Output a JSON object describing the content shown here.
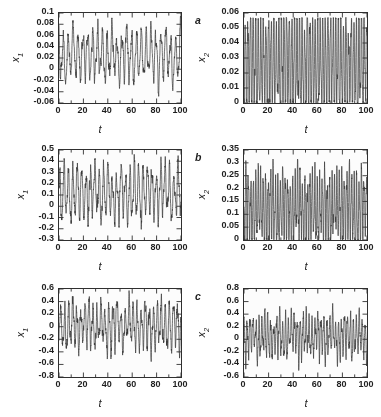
{
  "figure": {
    "rows": [
      "a",
      "b",
      "c"
    ],
    "line_color": "#333333",
    "frame_color": "#2b2b2b",
    "background": "#ffffff"
  },
  "chart_data": [
    {
      "id": "a-x1",
      "type": "line",
      "panel_label": "a",
      "title": "",
      "xlabel": "t",
      "ylabel": "x1",
      "ylabel_base": "x",
      "ylabel_sub": "1",
      "xlim": [
        0,
        100
      ],
      "ylim": [
        -0.06,
        0.1
      ],
      "xticks": [
        0,
        20,
        40,
        60,
        80,
        100
      ],
      "xticklabels": [
        "0",
        "20",
        "40",
        "60",
        "80",
        "100"
      ],
      "yticks": [
        -0.06,
        -0.04,
        -0.02,
        0,
        0.02,
        0.04,
        0.06,
        0.08,
        0.1
      ],
      "yticklabels": [
        "-0.06",
        "-0.04",
        "-0.02",
        "0",
        "0.02",
        "0.04",
        "0.06",
        "0.08",
        "0.1"
      ],
      "x_minor_step": 10,
      "grid": false,
      "legend": null,
      "series_description": "Chaotic oscillation, mean approx 0.025, spikes to 0.1 and dips to -0.055, dominant period approx 4 time units with slow amplitude modulation",
      "signal": {
        "mean": 0.025,
        "fast_period": 4.0,
        "fast_amp": 0.032,
        "slow_period": 11.0,
        "slow_amp": 0.022,
        "noise": 0.01,
        "clip_min": -0.058,
        "clip_max": 0.1
      }
    },
    {
      "id": "a-x2",
      "type": "line",
      "panel_label": "a",
      "title": "",
      "xlabel": "t",
      "ylabel": "x2",
      "ylabel_base": "x",
      "ylabel_sub": "2",
      "xlim": [
        0,
        100
      ],
      "ylim": [
        0,
        0.06
      ],
      "xticks": [
        0,
        20,
        40,
        60,
        80,
        100
      ],
      "xticklabels": [
        "0",
        "20",
        "40",
        "60",
        "80",
        "100"
      ],
      "yticks": [
        0,
        0.01,
        0.02,
        0.03,
        0.04,
        0.05,
        0.06
      ],
      "yticklabels": [
        "0",
        "0.01",
        "0.02",
        "0.03",
        "0.04",
        "0.05",
        "0.06"
      ],
      "x_minor_step": 10,
      "grid": false,
      "legend": null,
      "series_description": "Dense positive spiking oscillation between 0 and 0.055, rectified appearance, period approx 2 time units",
      "signal": {
        "mean": 0.026,
        "fast_period": 2.1,
        "fast_amp": 0.026,
        "slow_period": 9.0,
        "slow_amp": 0.006,
        "noise": 0.004,
        "clip_min": 0.0,
        "clip_max": 0.057
      }
    },
    {
      "id": "b-x1",
      "type": "line",
      "panel_label": "b",
      "title": "",
      "xlabel": "t",
      "ylabel": "x1",
      "ylabel_base": "x",
      "ylabel_sub": "1",
      "xlim": [
        0,
        100
      ],
      "ylim": [
        -0.3,
        0.5
      ],
      "xticks": [
        0,
        20,
        40,
        60,
        80,
        100
      ],
      "xticklabels": [
        "0",
        "20",
        "40",
        "60",
        "80",
        "100"
      ],
      "yticks": [
        -0.3,
        -0.2,
        -0.1,
        0,
        0.1,
        0.2,
        0.3,
        0.4,
        0.5
      ],
      "yticklabels": [
        "-0.3",
        "-0.2",
        "-0.1",
        "0",
        "0.1",
        "0.2",
        "0.3",
        "0.4",
        "0.5"
      ],
      "x_minor_step": 10,
      "grid": false,
      "legend": null,
      "series_description": "Chaotic oscillation about 0.12, peaks reaching 0.5 and troughs near -0.27, beating envelope of roughly 11 time units",
      "signal": {
        "mean": 0.12,
        "fast_period": 3.6,
        "fast_amp": 0.17,
        "slow_period": 11.5,
        "slow_amp": 0.11,
        "noise": 0.055,
        "clip_min": -0.28,
        "clip_max": 0.5
      }
    },
    {
      "id": "b-x2",
      "type": "line",
      "panel_label": "b",
      "title": "",
      "xlabel": "t",
      "ylabel": "x2",
      "ylabel_base": "x",
      "ylabel_sub": "2",
      "xlim": [
        0,
        100
      ],
      "ylim": [
        0,
        0.35
      ],
      "xticks": [
        0,
        20,
        40,
        60,
        80,
        100
      ],
      "xticklabels": [
        "0",
        "20",
        "40",
        "60",
        "80",
        "100"
      ],
      "yticks": [
        0,
        0.05,
        0.1,
        0.15,
        0.2,
        0.25,
        0.3,
        0.35
      ],
      "yticklabels": [
        "0",
        "0.05",
        "0.1",
        "0.15",
        "0.2",
        "0.25",
        "0.3",
        "0.35"
      ],
      "x_minor_step": 10,
      "grid": false,
      "legend": null,
      "series_description": "Dense positive spiking signal between 0 and 0.31 with recurring tall spikes every 10 time units",
      "signal": {
        "mean": 0.125,
        "fast_period": 2.0,
        "fast_amp": 0.105,
        "slow_period": 10.5,
        "slow_amp": 0.055,
        "noise": 0.028,
        "clip_min": 0.0,
        "clip_max": 0.315
      }
    },
    {
      "id": "c-x1",
      "type": "line",
      "panel_label": "c",
      "title": "",
      "xlabel": "t",
      "ylabel": "x1",
      "ylabel_base": "x",
      "ylabel_sub": "1",
      "xlim": [
        0,
        100
      ],
      "ylim": [
        -0.8,
        0.6
      ],
      "xticks": [
        0,
        20,
        40,
        60,
        80,
        100
      ],
      "xticklabels": [
        "0",
        "20",
        "40",
        "60",
        "80",
        "100"
      ],
      "yticks": [
        -0.8,
        -0.6,
        -0.4,
        -0.2,
        0,
        0.2,
        0.4,
        0.6
      ],
      "yticklabels": [
        "-0.8",
        "-0.6",
        "-0.4",
        "-0.2",
        "0",
        "0.2",
        "0.4",
        "0.6"
      ],
      "x_minor_step": 10,
      "grid": false,
      "legend": null,
      "series_description": "Strongly chaotic signal centred near 0 with peaks to 0.55 and deep troughs to -0.7, irregular amplitude bursts",
      "signal": {
        "mean": 0.02,
        "fast_period": 3.3,
        "fast_amp": 0.26,
        "slow_period": 12.0,
        "slow_amp": 0.2,
        "noise": 0.1,
        "clip_min": -0.72,
        "clip_max": 0.58
      }
    },
    {
      "id": "c-x2",
      "type": "line",
      "panel_label": "c",
      "title": "",
      "xlabel": "t",
      "ylabel": "x2",
      "ylabel_base": "x",
      "ylabel_sub": "2",
      "xlim": [
        0,
        100
      ],
      "ylim": [
        -0.6,
        0.8
      ],
      "xticks": [
        0,
        20,
        40,
        60,
        80,
        100
      ],
      "xticklabels": [
        "0",
        "20",
        "40",
        "60",
        "80",
        "100"
      ],
      "yticks": [
        -0.6,
        -0.4,
        -0.2,
        0,
        0.2,
        0.4,
        0.6,
        0.8
      ],
      "yticklabels": [
        "-0.6",
        "-0.4",
        "-0.2",
        "0",
        "0.2",
        "0.4",
        "0.6",
        "0.8"
      ],
      "x_minor_step": 10,
      "grid": false,
      "legend": null,
      "series_description": "Chaotic spiking signal centred near 0.05 with sharp positive bursts to 0.7 and troughs to -0.5",
      "signal": {
        "mean": 0.05,
        "fast_period": 2.4,
        "fast_amp": 0.23,
        "slow_period": 10.8,
        "slow_amp": 0.19,
        "noise": 0.085,
        "clip_min": -0.52,
        "clip_max": 0.72
      }
    }
  ]
}
